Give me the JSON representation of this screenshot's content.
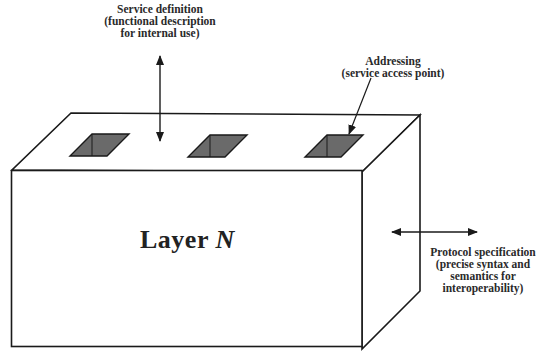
{
  "diagram": {
    "title_word": "Layer",
    "title_var": "N",
    "labels": {
      "service_definition": {
        "lines": [
          "Service definition",
          "(functional description",
          "for internal use)"
        ]
      },
      "addressing": {
        "lines": [
          "Addressing",
          "(service access point)"
        ]
      },
      "protocol_specification": {
        "lines": [
          "Protocol specification",
          "(precise syntax and",
          "semantics for",
          "interoperability)"
        ]
      }
    },
    "service_access_points": [
      {
        "id": "sap-1"
      },
      {
        "id": "sap-2"
      },
      {
        "id": "sap-3"
      }
    ],
    "colors": {
      "outline": "#1a1a1a",
      "hole_fill": "#6a6a6a",
      "box_fill": "#ffffff"
    }
  }
}
